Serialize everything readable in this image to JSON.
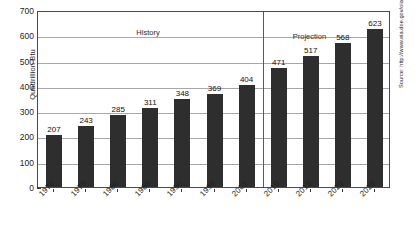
{
  "chart_data": {
    "type": "bar",
    "title": "",
    "xlabel": "",
    "ylabel": "Quadrillion Btu",
    "ylim": [
      0,
      700
    ],
    "yticks": [
      0,
      100,
      200,
      300,
      400,
      500,
      600,
      700
    ],
    "grid": true,
    "legend": "none",
    "categories": [
      "1970",
      "1975",
      "1980",
      "1985",
      "1990",
      "1995",
      "2001",
      "2010",
      "2015",
      "2020",
      "2025"
    ],
    "values": [
      207,
      243,
      285,
      311,
      348,
      369,
      404,
      471,
      517,
      568,
      623
    ],
    "data_labels": [
      "207",
      "243",
      "285",
      "311",
      "348",
      "369",
      "404",
      "471",
      "517",
      "568",
      "623"
    ],
    "annotations": [
      {
        "text": "History",
        "x_category": "1985"
      },
      {
        "text": "Projection",
        "x_category": "2015"
      }
    ],
    "divider_between": [
      "2001",
      "2010"
    ],
    "series_name": "World Energy Consumption",
    "bar_color": "#2e2e2e"
  },
  "axis": {
    "y_title": "Quadrillion Btu",
    "y_tick_labels": [
      "700",
      "600",
      "500",
      "400",
      "300",
      "200",
      "100",
      "0"
    ],
    "x_tick_labels": [
      "1970",
      "1975",
      "1980",
      "1985",
      "1990",
      "1995",
      "2001",
      "2010",
      "2015",
      "2020",
      "2025"
    ]
  },
  "labels": {
    "history": "History",
    "projection": "Projection"
  },
  "source": {
    "text": "Source: http://www.eia.doe.gov/oiaf/ieo/world.html"
  },
  "colors": {
    "bar": "#2e2e2e",
    "gridline": "#a8a8a8",
    "axis": "#4a4a4a",
    "background": "#ffffff",
    "text": "#1a1a1a"
  }
}
